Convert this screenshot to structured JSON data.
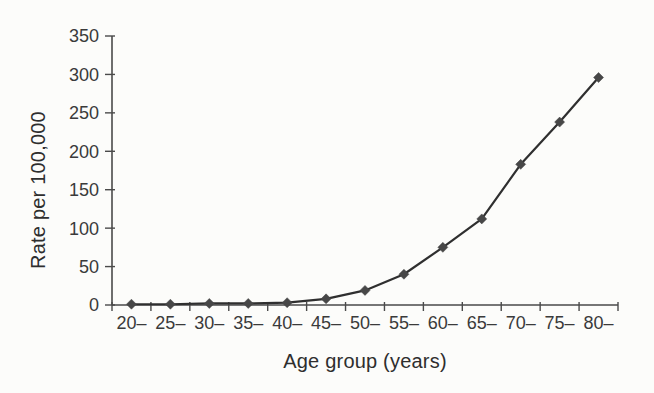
{
  "figure": {
    "background": "#fcfcfa"
  },
  "chart_data": {
    "type": "line",
    "title": "",
    "xlabel": "Age group (years)",
    "ylabel": "Rate per 100,000",
    "categories": [
      "20–",
      "25–",
      "30–",
      "35–",
      "40–",
      "45–",
      "50–",
      "55–",
      "60–",
      "65–",
      "70–",
      "75–",
      "80–"
    ],
    "series": [
      {
        "name": "rate",
        "values": [
          1,
          1,
          2,
          2,
          3,
          8,
          19,
          40,
          75,
          112,
          183,
          238,
          296
        ]
      }
    ],
    "ylim": [
      0,
      350
    ],
    "yticks": [
      0,
      50,
      100,
      150,
      200,
      250,
      300,
      350
    ],
    "grid": false,
    "legend_position": "none",
    "marker": "diamond",
    "line_color": "#2f2f2f",
    "marker_color": "#474747",
    "axis_color": "#4a4a4a",
    "tick_text_color": "#3a3a3a"
  }
}
